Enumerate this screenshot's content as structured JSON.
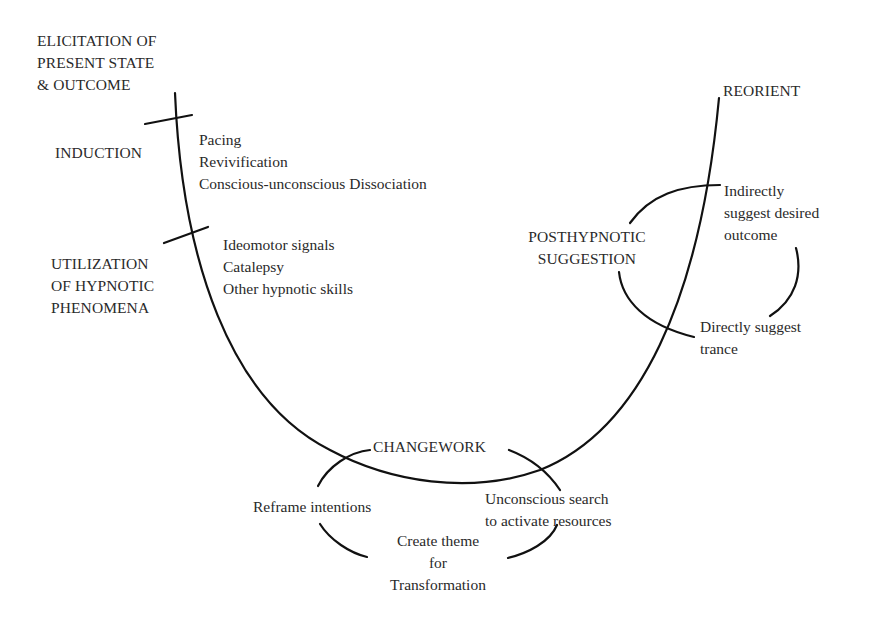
{
  "diagram": {
    "type": "process-curve",
    "stages": {
      "elicitation": [
        "ELICITATION OF",
        "PRESENT STATE",
        "& OUTCOME"
      ],
      "induction": [
        "INDUCTION"
      ],
      "utilization": [
        "UTILIZATION",
        "OF HYPNOTIC",
        "PHENOMENA"
      ],
      "changework": [
        "CHANGEWORK"
      ],
      "posthypnotic": [
        "POSTHYPNOTIC",
        "SUGGESTION"
      ],
      "reorient": [
        "REORIENT"
      ]
    },
    "induction_items": [
      "Pacing",
      "Revivification",
      "Conscious-unconscious Dissociation"
    ],
    "utilization_items": [
      "Ideomotor signals",
      "Catalepsy",
      "Other hypnotic skills"
    ],
    "posthypnotic_items": {
      "indirect": [
        "Indirectly",
        "suggest desired",
        "outcome"
      ],
      "direct": [
        "Directly suggest",
        "trance"
      ]
    },
    "changework_items": {
      "reframe": [
        "Reframe intentions"
      ],
      "search": [
        "Unconscious search",
        "to activate resources"
      ],
      "theme": [
        "Create theme",
        "for",
        "Transformation"
      ]
    },
    "colors": {
      "line": "#111111",
      "text": "#2a2a2a",
      "background": "#ffffff"
    }
  }
}
